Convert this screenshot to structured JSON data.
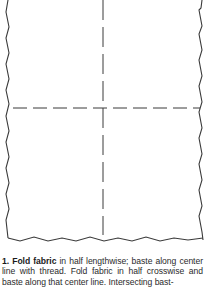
{
  "figure": {
    "stroke_color": "#3a3a3a",
    "background": "#ffffff"
  },
  "caption": {
    "step_label": "1. Fold fabric",
    "text": " in half lengthwise; baste along center line with thread. Fold fabric in half crosswise and baste along that center line. Intersecting bast-"
  }
}
